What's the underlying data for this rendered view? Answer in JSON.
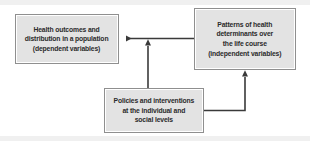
{
  "diagram": {
    "background_color": "#ffffff",
    "node_fill_color": "#e3e3e3",
    "node_border_color": "#8f8f8f",
    "text_color": "#2b2b2b",
    "arrow_color": "#3a3a3a",
    "nodes": [
      {
        "id": "outcomes",
        "label": "Health outcomes and\ndistribution in a population\n(dependent variables)",
        "lines": [
          "Health outcomes and",
          "distribution in a population",
          "(dependent variables)"
        ]
      },
      {
        "id": "determinants",
        "label": "Patterns of health\ndeterminants over\nthe life course\n(independent variables)",
        "lines": [
          "Patterns of health",
          "determinants over",
          "the life course",
          "(independent variables)"
        ]
      },
      {
        "id": "policies",
        "label": "Policies and interventions\nat the individual and\nsocial levels",
        "lines": [
          "Policies and interventions",
          "at the individual and",
          "social levels"
        ]
      }
    ],
    "arrows": [
      {
        "id": "determinants-to-outcomes",
        "from": "determinants",
        "to": "outcomes",
        "direction": "right-to-left",
        "style": "straight-horizontal"
      },
      {
        "id": "policies-to-outcomes-link",
        "from": "policies",
        "to": "determinants-to-outcomes",
        "direction": "bottom-to-top",
        "style": "straight-vertical"
      },
      {
        "id": "policies-to-determinants",
        "from": "policies",
        "to": "determinants",
        "direction": "left-to-right-then-up",
        "style": "elbow"
      }
    ]
  }
}
